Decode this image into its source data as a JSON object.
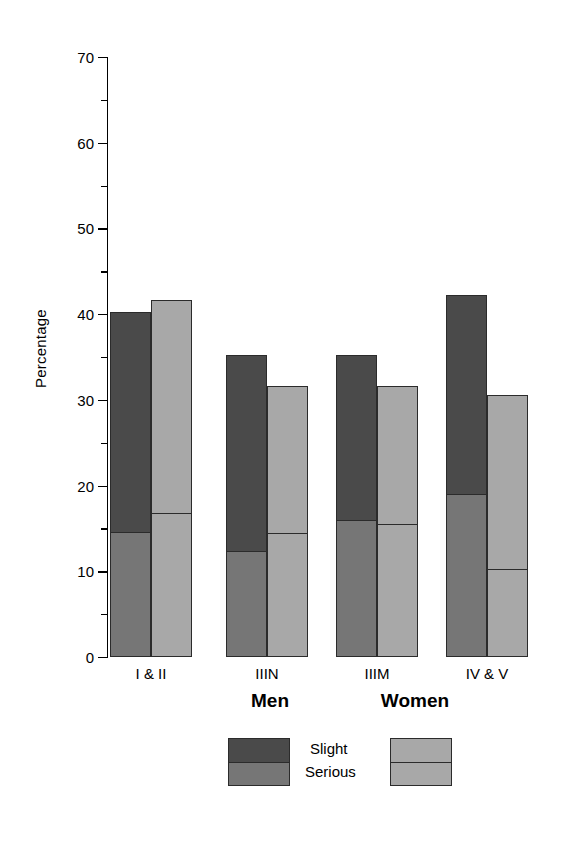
{
  "chart_data": {
    "type": "bar",
    "subtype": "stacked-grouped",
    "title": "",
    "xlabel": "",
    "ylabel": "Percentage",
    "ylim": [
      0,
      70
    ],
    "ytick_labels": [
      "0",
      "10",
      "20",
      "30",
      "40",
      "50",
      "60",
      "70"
    ],
    "ytick_values": [
      0,
      10,
      20,
      30,
      40,
      50,
      60,
      70
    ],
    "yminor_values": [
      5,
      15,
      25,
      35,
      45,
      55,
      65
    ],
    "grid": false,
    "legend_position": "bottom",
    "categories": [
      "I & II",
      "IIIN",
      "IIIM",
      "IV & V"
    ],
    "stack_order": [
      "Serious",
      "Slight"
    ],
    "series": [
      {
        "name": "Men",
        "segments": [
          {
            "name": "Serious",
            "color": "#767676",
            "values": [
              14.5,
              12.3,
              16.0,
              19.0
            ]
          },
          {
            "name": "Slight",
            "color": "#4a4a4a",
            "values": [
              25.7,
              22.9,
              19.2,
              23.2
            ]
          }
        ],
        "totals": [
          40.2,
          35.2,
          35.2,
          42.2
        ]
      },
      {
        "name": "Women",
        "segments": [
          {
            "name": "Serious",
            "color": "#a8a8a8",
            "values": [
              16.8,
              14.5,
              15.5,
              10.2
            ]
          },
          {
            "name": "Slight",
            "color": "#a8a8a8",
            "values": [
              24.9,
              17.1,
              16.1,
              20.4
            ]
          }
        ],
        "totals": [
          41.7,
          31.6,
          31.6,
          30.6
        ]
      }
    ]
  },
  "axis": {
    "ylabel": "Percentage",
    "ticks": [
      {
        "label": "70",
        "value": 70
      },
      {
        "label": "60",
        "value": 60
      },
      {
        "label": "50",
        "value": 50
      },
      {
        "label": "40",
        "value": 40
      },
      {
        "label": "30",
        "value": 30
      },
      {
        "label": "20",
        "value": 20
      },
      {
        "label": "10",
        "value": 10
      },
      {
        "label": "0",
        "value": 0
      }
    ]
  },
  "xaxis": {
    "labels": [
      "I & II",
      "IIIN",
      "IIIM",
      "IV & V"
    ]
  },
  "legend": {
    "men_title": "Men",
    "women_title": "Women",
    "key_slight": "Slight",
    "key_serious": "Serious",
    "men_slight_color": "#4a4a4a",
    "men_serious_color": "#767676",
    "women_slight_color": "#a8a8a8",
    "women_serious_color": "#a8a8a8"
  }
}
